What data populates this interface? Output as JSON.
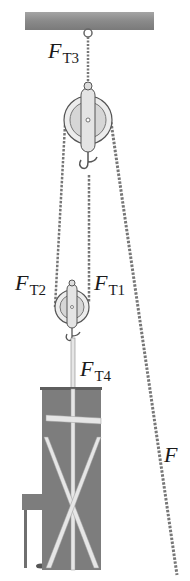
{
  "diagram": {
    "labels": {
      "ft3": {
        "main": "F",
        "sub": "T3"
      },
      "ft2": {
        "main": "F",
        "sub": "T2"
      },
      "ft1": {
        "main": "F",
        "sub": "T1"
      },
      "ft4": {
        "main": "F",
        "sub": "T4"
      },
      "f": {
        "main": "F",
        "sub": ""
      }
    },
    "colors": {
      "ceiling": "#8a8a8a",
      "rope": "#7a7a7a",
      "pulley": "#d8d8d8",
      "pulley_outline": "#555555",
      "piano": "#7d7d7d",
      "strap": "#e6e6e6"
    },
    "components": [
      "ceiling-beam",
      "upper-pulley",
      "lower-pulley",
      "rope",
      "pull-rope",
      "piano",
      "piano-straps"
    ]
  }
}
